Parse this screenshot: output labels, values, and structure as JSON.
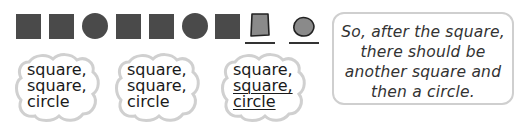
{
  "pattern": {
    "shapes": [
      "square",
      "square",
      "circle",
      "square",
      "square",
      "circle",
      "square"
    ],
    "answers": [
      {
        "shape": "square",
        "fill": "#8a8a8a",
        "outline": "#222222"
      },
      {
        "shape": "circle",
        "fill": "#8a8a8a",
        "outline": "#222222"
      }
    ],
    "color": "#4a4a4a"
  },
  "clouds": [
    {
      "lines": [
        "square,",
        "square,",
        "circle"
      ],
      "underlined": [
        false,
        false,
        false
      ]
    },
    {
      "lines": [
        "square,",
        "square,",
        "circle"
      ],
      "underlined": [
        false,
        false,
        false
      ]
    },
    {
      "lines": [
        "square,",
        "square,",
        "circle"
      ],
      "underlined": [
        false,
        true,
        true
      ]
    }
  ],
  "speech": {
    "lines": [
      "So, after the square,",
      "there should be",
      "another square and",
      "then a circle."
    ]
  }
}
